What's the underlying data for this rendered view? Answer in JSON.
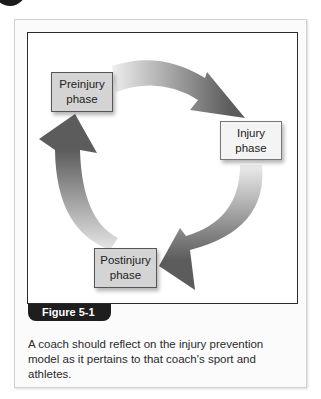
{
  "figure": {
    "label": "Figure 5-1",
    "caption": "A coach should reflect on the injury prevention model as it pertains to that coach's sport and athletes."
  },
  "diagram": {
    "type": "cycle",
    "phases": [
      {
        "id": "preinjury",
        "label": "Preinjury\nphase"
      },
      {
        "id": "injury",
        "label": "Injury\nphase"
      },
      {
        "id": "postinjury",
        "label": "Postinjury\nphase"
      }
    ],
    "flow": [
      "preinjury",
      "injury",
      "postinjury",
      "preinjury"
    ],
    "colors": {
      "arrow_dark": "#5f5f5f",
      "arrow_light": "#e6e6e6",
      "box_fill": "#d4d4d4",
      "box_fill_light": "#f4f4f4"
    }
  }
}
